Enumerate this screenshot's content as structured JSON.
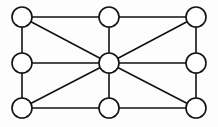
{
  "figure": {
    "background_color": "#fdfdfd",
    "line_color": "#111111",
    "node_fill_color": "#ffffff",
    "width": 218,
    "height": 127
  },
  "graph_data": {
    "type": "node-link",
    "directed": false,
    "weighted": false,
    "labeled": false,
    "node_count": 9,
    "edge_count": 16,
    "node_radius": 10,
    "nodes": [
      {
        "id": "top-left",
        "x": 22,
        "y": 17,
        "position": "top-left"
      },
      {
        "id": "top-center",
        "x": 109,
        "y": 17,
        "position": "top-center"
      },
      {
        "id": "top-right",
        "x": 196,
        "y": 17,
        "position": "top-right"
      },
      {
        "id": "mid-left",
        "x": 22,
        "y": 63,
        "position": "middle-left"
      },
      {
        "id": "center",
        "x": 109,
        "y": 63,
        "position": "center"
      },
      {
        "id": "mid-right",
        "x": 196,
        "y": 63,
        "position": "middle-right"
      },
      {
        "id": "bottom-left",
        "x": 22,
        "y": 108,
        "position": "bottom-left"
      },
      {
        "id": "bottom-center",
        "x": 109,
        "y": 108,
        "position": "bottom-center"
      },
      {
        "id": "bottom-right",
        "x": 196,
        "y": 108,
        "position": "bottom-right"
      }
    ],
    "edges": [
      {
        "source": "top-left",
        "target": "top-center",
        "kind": "perimeter"
      },
      {
        "source": "top-center",
        "target": "top-right",
        "kind": "perimeter"
      },
      {
        "source": "top-right",
        "target": "mid-right",
        "kind": "perimeter"
      },
      {
        "source": "mid-right",
        "target": "bottom-right",
        "kind": "perimeter"
      },
      {
        "source": "bottom-right",
        "target": "bottom-center",
        "kind": "perimeter"
      },
      {
        "source": "bottom-center",
        "target": "bottom-left",
        "kind": "perimeter"
      },
      {
        "source": "bottom-left",
        "target": "mid-left",
        "kind": "perimeter"
      },
      {
        "source": "mid-left",
        "target": "top-left",
        "kind": "perimeter"
      },
      {
        "source": "center",
        "target": "top-left",
        "kind": "spoke"
      },
      {
        "source": "center",
        "target": "top-center",
        "kind": "spoke"
      },
      {
        "source": "center",
        "target": "top-right",
        "kind": "spoke"
      },
      {
        "source": "center",
        "target": "mid-left",
        "kind": "spoke"
      },
      {
        "source": "center",
        "target": "mid-right",
        "kind": "spoke"
      },
      {
        "source": "center",
        "target": "bottom-left",
        "kind": "spoke"
      },
      {
        "source": "center",
        "target": "bottom-center",
        "kind": "spoke"
      },
      {
        "source": "center",
        "target": "bottom-right",
        "kind": "spoke"
      }
    ]
  }
}
